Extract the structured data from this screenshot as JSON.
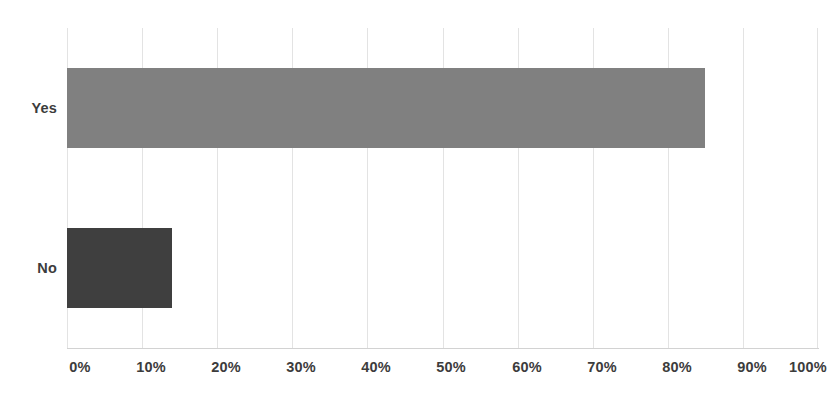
{
  "chart_data": {
    "type": "bar",
    "orientation": "horizontal",
    "title": "",
    "subtitle": "",
    "xlabel": "",
    "ylabel": "",
    "categories": [
      "Yes",
      "No"
    ],
    "values": [
      85,
      14
    ],
    "value_labels": [
      "85%",
      "14%"
    ],
    "xlim": [
      0,
      100
    ],
    "xticks": [
      0,
      10,
      20,
      30,
      40,
      50,
      60,
      70,
      80,
      90,
      100
    ],
    "xtick_labels": [
      "0%",
      "10%",
      "20%",
      "30%",
      "40%",
      "50%",
      "60%",
      "70%",
      "80%",
      "90%",
      "100%"
    ],
    "grid": true,
    "grid_axis": "x",
    "legend": false,
    "legend_position": "none",
    "annotations": [],
    "series": [
      {
        "name": "Response share",
        "values": [
          85,
          14
        ],
        "colors": [
          "#808080",
          "#3f3f3f"
        ]
      }
    ],
    "bar_colors": {
      "Yes": "#808080",
      "No": "#3f3f3f"
    }
  },
  "axes": {
    "x_tick_labels": [
      "0%",
      "10%",
      "20%",
      "30%",
      "40%",
      "50%",
      "60%",
      "70%",
      "80%",
      "90%",
      "100%"
    ],
    "y_tick_labels": [
      "Yes",
      "No"
    ]
  },
  "colors": {
    "background": "#ffffff",
    "gridline": "#e3e3e3",
    "axis_line": "#d2d2d2",
    "tick_text": "#3c3c3c",
    "bar_yes": "#808080",
    "bar_no": "#3f3f3f"
  }
}
